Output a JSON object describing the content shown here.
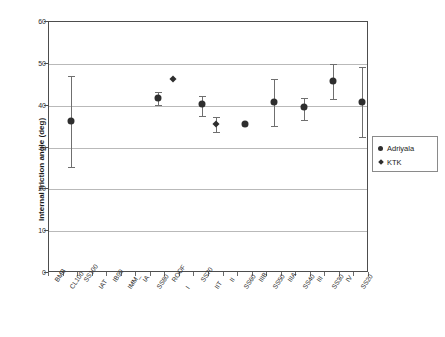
{
  "chart_data": {
    "type": "scatter",
    "title": "",
    "xlabel": "",
    "ylabel": "Internal friction angle (deg)",
    "ylim": [
      0,
      60
    ],
    "yticks": [
      0,
      10,
      20,
      30,
      40,
      50,
      60
    ],
    "grid": true,
    "legend_position": "right",
    "categories": [
      "BMB",
      "CL100",
      "SS100",
      "IAT",
      "IB90",
      "IMM_",
      "IA",
      "SS80",
      "ROOF",
      "I",
      "SS70",
      "IIT",
      "II",
      "SS60",
      "IIIB",
      "SS50",
      "IIIA",
      "SS40",
      "III",
      "SS30",
      "IV",
      "SS20"
    ],
    "series": [
      {
        "name": "Adriyala",
        "marker": "circle",
        "color": "#2e2e2e",
        "points": [
          {
            "category": "CL100",
            "value": 36.3,
            "low": 25.3,
            "high": 47.0
          },
          {
            "category": "SS80",
            "value": 41.9,
            "low": 40.2,
            "high": 43.2
          },
          {
            "category": "SS70",
            "value": 40.3,
            "low": 37.6,
            "high": 42.3
          },
          {
            "category": "SS60",
            "value": 35.7,
            "low": 35.7,
            "high": 35.7
          },
          {
            "category": "SS50",
            "value": 40.9,
            "low": 35.1,
            "high": 46.4
          },
          {
            "category": "SS40",
            "value": 39.7,
            "low": 36.6,
            "high": 41.8
          },
          {
            "category": "SS30",
            "value": 45.8,
            "low": 41.7,
            "high": 50.0
          },
          {
            "category": "SS20",
            "value": 40.8,
            "low": 32.6,
            "high": 49.2
          }
        ]
      },
      {
        "name": "KTK",
        "marker": "diamond",
        "color": "#2e2e2e",
        "points": [
          {
            "category": "ROOF",
            "value": 46.4,
            "low": 46.4,
            "high": 46.4
          },
          {
            "category": "IIT",
            "value": 35.6,
            "low": 33.8,
            "high": 37.2
          }
        ]
      }
    ]
  },
  "legend": {
    "items": [
      {
        "label": "Adriyala",
        "marker": "circle"
      },
      {
        "label": "KTK",
        "marker": "diamond"
      }
    ]
  }
}
